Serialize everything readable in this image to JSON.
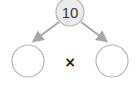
{
  "diagram": {
    "type": "number-bond",
    "top_value": "10",
    "operator": "×",
    "left_value": "",
    "right_value": "",
    "colors": {
      "top_fill": "#ebebeb",
      "circle_stroke": "#b5b5b5",
      "arrow": "#a8a8a8",
      "text": "#3a3a3a"
    }
  }
}
